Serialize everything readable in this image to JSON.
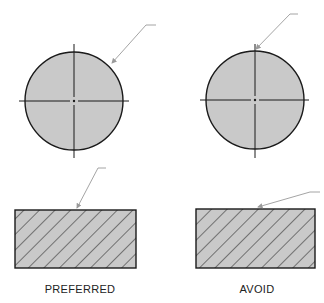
{
  "figure": {
    "colors": {
      "fill": "#c9c9c9",
      "outline": "#1a1a1a",
      "leader": "#9a9a9a",
      "background": "#ffffff"
    },
    "panels": [
      {
        "id": "preferred",
        "caption": "PREFERRED",
        "circle": {
          "cx": 74,
          "cy": 101,
          "r": 49,
          "leader_touches": "circumference"
        },
        "rectangle": {
          "x": 15,
          "y": 210,
          "w": 121,
          "h": 58,
          "hatch": "45deg"
        }
      },
      {
        "id": "avoid",
        "caption": "AVOID",
        "circle": {
          "cx": 255,
          "cy": 100,
          "r": 49,
          "leader_touches": "centerline-intersection"
        },
        "rectangle": {
          "x": 196,
          "y": 209,
          "w": 119,
          "h": 59,
          "hatch": "45deg"
        }
      }
    ]
  }
}
